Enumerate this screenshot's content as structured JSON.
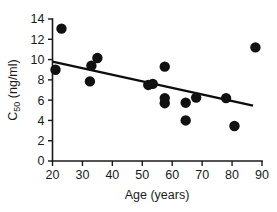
{
  "chart_data": {
    "type": "scatter",
    "title": "",
    "xlabel": "Age (years)",
    "ylabel_main": "C",
    "ylabel_sub": "50",
    "ylabel_units": " (ng/ml)",
    "ylabel_full": "C50 (ng/ml)",
    "xlim": [
      20,
      90
    ],
    "ylim": [
      0,
      14
    ],
    "xticks": [
      20,
      30,
      40,
      50,
      60,
      70,
      80,
      90
    ],
    "yticks": [
      0,
      2,
      4,
      6,
      8,
      10,
      12,
      14
    ],
    "xtick_labels": [
      "20",
      "30",
      "40",
      "50",
      "60",
      "70",
      "80",
      "90"
    ],
    "ytick_labels": [
      "0",
      "2",
      "4",
      "6",
      "8",
      "10",
      "12",
      "14"
    ],
    "grid": false,
    "legend": false,
    "marker": "filled-circle",
    "marker_color": "#111111",
    "marker_size": 5.2,
    "series": [
      {
        "name": "Subjects",
        "x": [
          21.0,
          23.0,
          32.5,
          33.0,
          35.0,
          52.0,
          53.5,
          57.5,
          57.5,
          57.5,
          64.5,
          64.5,
          68.0,
          78.0,
          80.8,
          87.8
        ],
        "y": [
          9.0,
          13.05,
          7.85,
          9.4,
          10.15,
          7.5,
          7.6,
          9.3,
          5.7,
          6.2,
          5.75,
          4.0,
          6.25,
          6.2,
          3.45,
          11.2
        ]
      }
    ],
    "trend": {
      "type": "line",
      "x": [
        20.0,
        87.0
      ],
      "y": [
        9.8,
        5.45
      ],
      "color": "#0d0d0d"
    }
  }
}
